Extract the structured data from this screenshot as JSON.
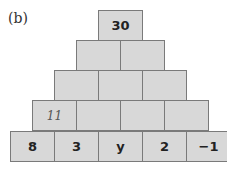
{
  "label": "(b)",
  "pyramid": {
    "rows": [
      [
        "30"
      ],
      [
        "",
        ""
      ],
      [
        "",
        "",
        ""
      ],
      [
        "11",
        "",
        "",
        ""
      ],
      [
        "8",
        "3",
        "y",
        "2",
        "−1"
      ]
    ],
    "box_color": "#d8d8d8",
    "border_color": "#7a7a7a"
  }
}
